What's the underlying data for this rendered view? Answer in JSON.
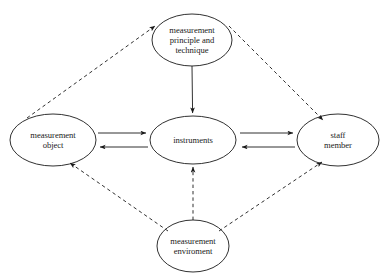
{
  "diagram": {
    "background_color": "#ffffff",
    "stroke_color": "#1a1a1a",
    "nodes": {
      "principle": {
        "label": "measurement\nprinciple and\ntechnique",
        "cx": 192,
        "cy": 40,
        "rx": 40,
        "ry": 26
      },
      "object": {
        "label": "measurement\nobject",
        "cx": 53,
        "cy": 140,
        "rx": 43,
        "ry": 26
      },
      "instruments": {
        "label": "instruments",
        "cx": 193,
        "cy": 140,
        "rx": 43,
        "ry": 24
      },
      "staff": {
        "label": "staff\nmember",
        "cx": 338,
        "cy": 140,
        "rx": 41,
        "ry": 26
      },
      "environment": {
        "label": "measurement\nenviroment",
        "cx": 193,
        "cy": 246,
        "rx": 36,
        "ry": 26
      }
    },
    "edges": [
      {
        "name": "object-to-instruments",
        "from": "object",
        "to": "instruments",
        "style": "solid",
        "arrow": "end"
      },
      {
        "name": "instruments-to-object",
        "from": "instruments",
        "to": "object",
        "style": "solid",
        "arrow": "end"
      },
      {
        "name": "instruments-to-staff",
        "from": "instruments",
        "to": "staff",
        "style": "solid",
        "arrow": "end"
      },
      {
        "name": "staff-to-instruments",
        "from": "staff",
        "to": "instruments",
        "style": "solid",
        "arrow": "end"
      },
      {
        "name": "principle-to-instruments",
        "from": "principle",
        "to": "instruments",
        "style": "solid",
        "arrow": "end"
      },
      {
        "name": "environment-to-instruments",
        "from": "environment",
        "to": "instruments",
        "style": "dashed",
        "arrow": "end"
      },
      {
        "name": "object-to-principle",
        "from": "object",
        "to": "principle",
        "style": "dashed",
        "arrow": "end"
      },
      {
        "name": "principle-to-staff",
        "from": "principle",
        "to": "staff",
        "style": "dashed",
        "arrow": "end"
      },
      {
        "name": "environment-to-object",
        "from": "environment",
        "to": "object",
        "style": "dashed",
        "arrow": "end"
      },
      {
        "name": "environment-to-staff",
        "from": "environment",
        "to": "staff",
        "style": "dashed",
        "arrow": "end"
      }
    ]
  }
}
